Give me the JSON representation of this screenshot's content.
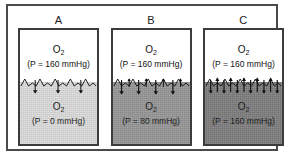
{
  "figure": {
    "type": "diagram",
    "panels": [
      {
        "letter": "A",
        "top": {
          "gas": "O",
          "gas_sub": "2",
          "pressure_label": "(P = 160  mmHg)",
          "pressure_value": 160,
          "fill_color": "#ffffff"
        },
        "bottom": {
          "gas": "O",
          "gas_sub": "2",
          "pressure_label": "(P = 0  mmHg)",
          "pressure_value": 0,
          "fill_color": "#dcdcdc"
        },
        "arrows": {
          "down_count": 3,
          "up_count": 0,
          "down_length": 13,
          "up_length": 0
        }
      },
      {
        "letter": "B",
        "top": {
          "gas": "O",
          "gas_sub": "2",
          "pressure_label": "(P = 160  mmHg)",
          "pressure_value": 160,
          "fill_color": "#ffffff"
        },
        "bottom": {
          "gas": "O",
          "gas_sub": "2",
          "pressure_label": "(P = 80  mmHg)",
          "pressure_value": 80,
          "fill_color": "#969696"
        },
        "arrows": {
          "down_count": 4,
          "up_count": 4,
          "down_length": 14,
          "up_length": 7
        }
      },
      {
        "letter": "C",
        "top": {
          "gas": "O",
          "gas_sub": "2",
          "pressure_label": "(P = 160  mmHg)",
          "pressure_value": 160,
          "fill_color": "#ffffff"
        },
        "bottom": {
          "gas": "O",
          "gas_sub": "2",
          "pressure_label": "(P = 160  mmHg)",
          "pressure_value": 160,
          "fill_color": "#7d7d7d"
        },
        "arrows": {
          "down_count": 6,
          "up_count": 6,
          "down_length": 13,
          "up_length": 13
        }
      }
    ],
    "colors": {
      "frame": "#4a4a4a",
      "chamber_border": "#3c3c3c",
      "ink": "#121212",
      "background": "#ffffff"
    }
  }
}
